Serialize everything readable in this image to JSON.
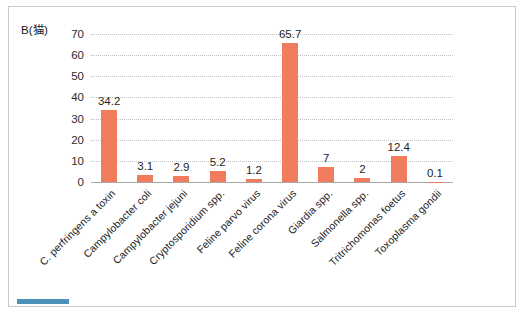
{
  "figure": {
    "title": "B(猫)",
    "accent_color": "#4a90b8",
    "bar_color": "#f07b5d",
    "frame_border_color": "#c9c9c9"
  },
  "chart_data": {
    "type": "bar",
    "title": "B(猫)",
    "xlabel": "",
    "ylabel": "",
    "ylim": [
      0,
      70
    ],
    "yticks": [
      0,
      10,
      20,
      30,
      40,
      50,
      60,
      70
    ],
    "grid": true,
    "legend": false,
    "data_labels_shown": true,
    "categories": [
      "C. perfringens a toxin",
      "Campylobacter coli",
      "Campylobacter jejuni",
      "Cryptosporidium spp.",
      "Feline parvo virus",
      "Feline corona virus",
      "Giardia spp.",
      "Salmonella spp.",
      "Tritrichomonas foetus",
      "Toxoplasma gondii"
    ],
    "values": [
      34.2,
      3.1,
      2.9,
      5.2,
      1.2,
      65.7,
      7,
      2,
      12.4,
      0.1
    ],
    "value_labels": [
      "34.2",
      "3.1",
      "2.9",
      "5.2",
      "1.2",
      "65.7",
      "7",
      "2",
      "12.4",
      "0.1"
    ]
  }
}
